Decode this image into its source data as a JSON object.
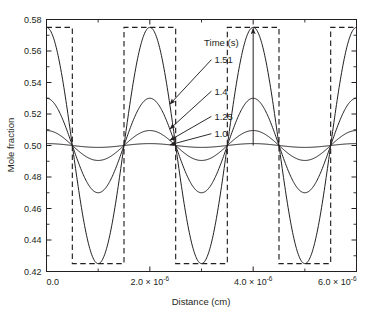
{
  "chart_data": {
    "type": "line",
    "title": "",
    "xlabel": "Distance (cm)",
    "ylabel": "Mole fraction",
    "xlim": [
      0,
      6e-06
    ],
    "ylim": [
      0.42,
      0.58
    ],
    "grid": false,
    "legend_position": "inside-upper-center",
    "legend_title": "Time (s)",
    "x_tick_labels": [
      "0.0",
      "2.0 × 10",
      "4.0 × 10",
      "6.0 × 10"
    ],
    "x_tick_exponents": [
      "",
      "-6",
      "-6",
      "-6"
    ],
    "x_tick_values": [
      0,
      2e-06,
      4e-06,
      6e-06
    ],
    "x_minor_tick_values": [
      1e-06,
      3e-06,
      5e-06
    ],
    "y_tick_labels": [
      "0.42",
      "0.44",
      "0.46",
      "0.48",
      "0.50",
      "0.52",
      "0.54",
      "0.56",
      "0.58"
    ],
    "y_tick_values": [
      0.42,
      0.44,
      0.46,
      0.48,
      0.5,
      0.52,
      0.54,
      0.56,
      0.58
    ],
    "square_wave": {
      "name": "target square wave",
      "style": "dashed",
      "high": 0.575,
      "low": 0.425,
      "period": 2e-06,
      "transitions": [
        5e-07,
        1.5e-06,
        2.5e-06,
        3.5e-06,
        4.5e-06,
        5.5e-06
      ],
      "start_level": "high"
    },
    "series": [
      {
        "name": "1.0",
        "time_s": 1.0,
        "mean": 0.5,
        "amplitude": 0.0012,
        "period": 2e-06,
        "phase": "cosine",
        "max": 0.5012,
        "min": 0.4988
      },
      {
        "name": "1.25",
        "time_s": 1.25,
        "mean": 0.5,
        "amplitude": 0.0095,
        "period": 2e-06,
        "phase": "cosine",
        "max": 0.5095,
        "min": 0.4905
      },
      {
        "name": "1.4",
        "time_s": 1.4,
        "mean": 0.5,
        "amplitude": 0.03,
        "period": 2e-06,
        "phase": "cosine",
        "max": 0.53,
        "min": 0.47
      },
      {
        "name": "1.51",
        "time_s": 1.51,
        "mean": 0.5,
        "amplitude": 0.075,
        "period": 2e-06,
        "phase": "cosine",
        "max": 0.575,
        "min": 0.425
      }
    ],
    "annotations": [
      {
        "label": "Time (s)",
        "kind": "legend-title",
        "x": 3.05e-06,
        "y": 0.5655
      },
      {
        "label": "1.51",
        "kind": "curve-callout",
        "x": 3.25e-06,
        "y": 0.5545,
        "target_series": "1.51"
      },
      {
        "label": "1.4",
        "kind": "curve-callout",
        "x": 3.25e-06,
        "y": 0.5345,
        "target_series": "1.4"
      },
      {
        "label": "1.25",
        "kind": "curve-callout",
        "x": 3.25e-06,
        "y": 0.5185,
        "target_series": "1.25"
      },
      {
        "label": "1.0",
        "kind": "curve-callout",
        "x": 3.25e-06,
        "y": 0.5075,
        "target_series": "1.0"
      },
      {
        "label": "",
        "kind": "vertical-amplitude-arrow",
        "x": 4e-06,
        "y_from": 0.5,
        "y_to": 0.575
      }
    ]
  }
}
